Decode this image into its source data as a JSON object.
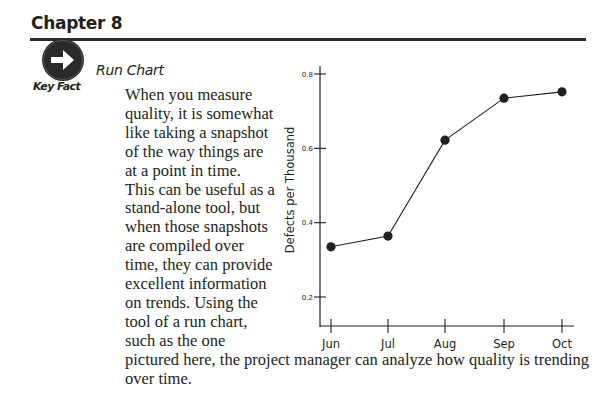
{
  "header": {
    "chapter_title": "Chapter 8"
  },
  "callout": {
    "icon": "arrow-right-circle-icon",
    "label": "Key Fact",
    "section_title": "Run Chart"
  },
  "body": {
    "lines": [
      "When you measure",
      "quality, it is somewhat",
      "like taking a snapshot",
      "of the way things are",
      "at a point in time.",
      "This can be useful as a",
      "stand-alone tool, but",
      "when those snapshots",
      "are compiled over",
      "time, they can provide",
      "excellent information",
      "on trends. Using the",
      "tool of a run chart,",
      "such as the one",
      "pictured here, the project manager can analyze how quality is trending",
      "over time."
    ]
  },
  "colors": {
    "text": "#231f20",
    "rule": "#2b2b2b",
    "icon_bg": "#2a2a2a",
    "marker": "#231f20"
  },
  "chart_data": {
    "type": "line",
    "title": "",
    "xlabel": "",
    "ylabel": "Defects per Thousand",
    "categories": [
      "Jun",
      "Jul",
      "Aug",
      "Sep",
      "Oct"
    ],
    "series": [
      {
        "name": "Defects per Thousand",
        "values": [
          0.335,
          0.364,
          0.622,
          0.735,
          0.752
        ]
      }
    ],
    "y_ticks": [
      "0.2",
      "0.4",
      "0.6",
      "0.8"
    ],
    "ylim": [
      0.1,
      0.82
    ],
    "grid": false,
    "legend": "none",
    "markers": "filled-circle"
  }
}
